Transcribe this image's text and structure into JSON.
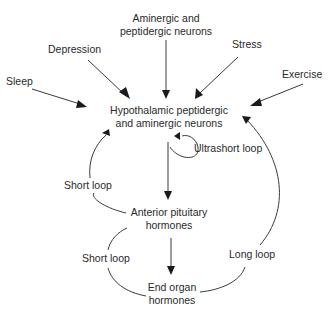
{
  "diagram": {
    "nodes": {
      "aminergic": {
        "line1": "Aminergic and",
        "line2": "peptidergic neurons"
      },
      "depression": {
        "label": "Depression"
      },
      "stress": {
        "label": "Stress"
      },
      "sleep": {
        "label": "Sleep"
      },
      "exercise": {
        "label": "Exercise"
      },
      "hypothalamic": {
        "line1": "Hypothalamic peptidergic",
        "line2": "and aminergic neurons"
      },
      "anterior_pituitary": {
        "line1": "Anterior pituitary",
        "line2": "hormones"
      },
      "end_organ": {
        "line1": "End organ",
        "line2": "hormones"
      }
    },
    "loops": {
      "ultrashort": "Ultrashort loop",
      "short_upper": "Short loop",
      "short_lower": "Short loop",
      "long": "Long loop"
    },
    "edges": [
      {
        "from": "Aminergic and peptidergic neurons",
        "to": "Hypothalamic peptidergic and aminergic neurons"
      },
      {
        "from": "Depression",
        "to": "Hypothalamic peptidergic and aminergic neurons"
      },
      {
        "from": "Stress",
        "to": "Hypothalamic peptidergic and aminergic neurons"
      },
      {
        "from": "Sleep",
        "to": "Hypothalamic peptidergic and aminergic neurons"
      },
      {
        "from": "Exercise",
        "to": "Hypothalamic peptidergic and aminergic neurons"
      },
      {
        "from": "Hypothalamic peptidergic and aminergic neurons",
        "to": "Anterior pituitary hormones"
      },
      {
        "from": "Anterior pituitary hormones",
        "to": "End organ hormones"
      },
      {
        "from": "Hypothalamic peptidergic and aminergic neurons",
        "to": "Hypothalamic peptidergic and aminergic neurons",
        "label": "Ultrashort loop"
      },
      {
        "from": "Anterior pituitary hormones",
        "to": "Hypothalamic peptidergic and aminergic neurons",
        "label": "Short loop"
      },
      {
        "from": "End organ hormones",
        "to": "Anterior pituitary hormones",
        "label": "Short loop"
      },
      {
        "from": "End organ hormones",
        "to": "Hypothalamic peptidergic and aminergic neurons",
        "label": "Long loop"
      }
    ]
  }
}
